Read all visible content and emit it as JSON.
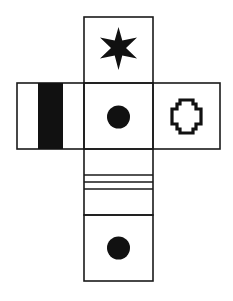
{
  "diagram": {
    "type": "cube-net",
    "colors": {
      "stroke": "#1a1a1a",
      "fill": "#111111",
      "background": "#ffffff"
    },
    "faces": [
      {
        "id": "top",
        "symbol": "six-pointed-star"
      },
      {
        "id": "left",
        "symbol": "vertical-black-bar"
      },
      {
        "id": "center",
        "symbol": "black-dot"
      },
      {
        "id": "right",
        "symbol": "outlined-cross"
      },
      {
        "id": "below-center",
        "symbol": "three-horizontal-lines"
      },
      {
        "id": "bottom",
        "symbol": "black-dot"
      }
    ]
  }
}
